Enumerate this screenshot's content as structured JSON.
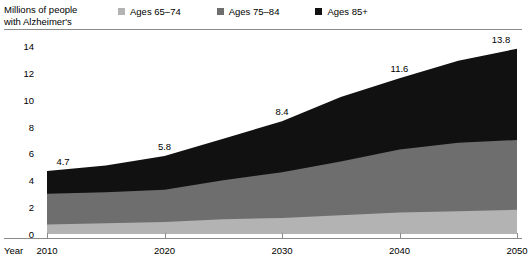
{
  "axis_title_line1": "Millions of people",
  "axis_title_line2": "with Alzheimer's",
  "year_axis_label": "Year",
  "legend": {
    "items": [
      {
        "label": "Ages 65–74",
        "color": "#b3b3b3",
        "swatch_name": "legend-swatch-ages-65-74"
      },
      {
        "label": "Ages 75–84",
        "color": "#6e6e6e",
        "swatch_name": "legend-swatch-ages-75-84"
      },
      {
        "label": "Ages 85+",
        "color": "#111111",
        "swatch_name": "legend-swatch-ages-85-plus"
      }
    ]
  },
  "chart_data": {
    "type": "area",
    "title": "Millions of people with Alzheimer's",
    "xlabel": "Year",
    "ylabel": "Millions of people with Alzheimer's",
    "stacked": true,
    "grid": false,
    "legend_position": "top",
    "xlim": [
      2010,
      2050
    ],
    "ylim": [
      0,
      14
    ],
    "yticks": [
      0,
      2,
      4,
      6,
      8,
      10,
      12,
      14
    ],
    "xticks": [
      2010,
      2020,
      2030,
      2040,
      2050
    ],
    "ytick_labels": [
      "0",
      "2",
      "4",
      "6",
      "8",
      "10",
      "12",
      "14"
    ],
    "xtick_labels": [
      "2010",
      "2020",
      "2030",
      "2040",
      "2050"
    ],
    "x": [
      2010,
      2015,
      2020,
      2025,
      2030,
      2035,
      2040,
      2045,
      2050
    ],
    "series": [
      {
        "name": "Ages 65–74",
        "color": "#b3b3b3",
        "values": [
          0.7,
          0.8,
          0.9,
          1.1,
          1.2,
          1.4,
          1.6,
          1.7,
          1.8
        ]
      },
      {
        "name": "Ages 75–84",
        "color": "#6e6e6e",
        "values": [
          2.3,
          2.3,
          2.4,
          2.9,
          3.4,
          4.0,
          4.7,
          5.1,
          5.2
        ]
      },
      {
        "name": "Ages 85+",
        "color": "#111111",
        "values": [
          1.7,
          2.0,
          2.5,
          3.1,
          3.8,
          4.8,
          5.3,
          6.1,
          6.8
        ]
      }
    ],
    "totals": [
      4.7,
      5.1,
      5.8,
      7.1,
      8.4,
      10.2,
      11.6,
      12.9,
      13.8
    ],
    "annotations": [
      {
        "x": 2010,
        "total": 4.7,
        "text": "4.7"
      },
      {
        "x": 2020,
        "total": 5.8,
        "text": "5.8"
      },
      {
        "x": 2030,
        "total": 8.4,
        "text": "8.4"
      },
      {
        "x": 2040,
        "total": 11.6,
        "text": "11.6"
      },
      {
        "x": 2050,
        "total": 13.8,
        "text": "13.8"
      }
    ]
  }
}
